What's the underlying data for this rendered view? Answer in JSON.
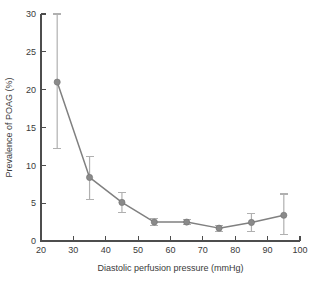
{
  "chart_data": {
    "type": "line",
    "title": "",
    "xlabel": "Diastolic perfusion pressure (mmHg)",
    "ylabel": "Prevalence of POAG (%)",
    "xlim": [
      20,
      100
    ],
    "ylim": [
      0,
      30
    ],
    "xticks": [
      20,
      30,
      40,
      50,
      60,
      70,
      80,
      90,
      100
    ],
    "yticks": [
      0,
      5,
      10,
      15,
      20,
      25,
      30
    ],
    "xtick_labels": [
      "20",
      "30",
      "40",
      "50",
      "60",
      "70",
      "80",
      "90",
      "100"
    ],
    "ytick_labels": [
      "0",
      "5",
      "10",
      "15",
      "20",
      "25",
      "30"
    ],
    "grid": false,
    "legend": null,
    "error_bars": true,
    "x": [
      25,
      35,
      45,
      55,
      65,
      75,
      85,
      95
    ],
    "values": [
      21.0,
      8.4,
      5.1,
      2.5,
      2.5,
      1.7,
      2.45,
      3.4
    ],
    "error_low": [
      12.2,
      5.5,
      3.8,
      2.0,
      2.2,
      1.3,
      1.3,
      0.9
    ],
    "error_high": [
      30.0,
      11.2,
      6.4,
      3.0,
      2.8,
      2.1,
      3.6,
      6.2
    ],
    "series": [
      {
        "name": "Prevalence of POAG",
        "points": [
          {
            "x": 25,
            "y": 21.0,
            "low": 12.2,
            "high": 30.0
          },
          {
            "x": 35,
            "y": 8.4,
            "low": 5.5,
            "high": 11.2
          },
          {
            "x": 45,
            "y": 5.1,
            "low": 3.8,
            "high": 6.4
          },
          {
            "x": 55,
            "y": 2.5,
            "low": 2.0,
            "high": 3.0
          },
          {
            "x": 65,
            "y": 2.5,
            "low": 2.2,
            "high": 2.8
          },
          {
            "x": 75,
            "y": 1.7,
            "low": 1.3,
            "high": 2.1
          },
          {
            "x": 85,
            "y": 2.45,
            "low": 1.3,
            "high": 3.6
          },
          {
            "x": 95,
            "y": 3.4,
            "low": 0.9,
            "high": 6.2
          }
        ]
      }
    ],
    "colors": {
      "line": "#808080",
      "marker": "#8a8a8a",
      "error_bar": "#b0b0b0",
      "axis": "#4d4d4d",
      "text": "#3a3a3a",
      "background": "#ffffff"
    }
  }
}
